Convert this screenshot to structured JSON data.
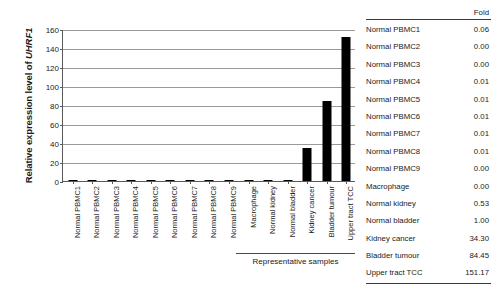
{
  "chart_data": {
    "type": "bar",
    "title": "",
    "xlabel": "Representative samples",
    "ylabel": "Relative expression level of UHRF1",
    "ylabel_plain": "Relative expression level of ",
    "ylabel_gene": "UHRF1",
    "ylim": [
      0,
      160
    ],
    "ytick_step": 20,
    "yticks": [
      0,
      20,
      40,
      60,
      80,
      100,
      120,
      140,
      160
    ],
    "grid": true,
    "legend": "none",
    "bar_color": "#000000",
    "categories": [
      "Normal PBMC1",
      "Normal PBMC2",
      "Normal PBMC3",
      "Normal PBMC4",
      "Normal PBMC5",
      "Normal PBMC6",
      "Normal PBMC7",
      "Normal PBMC8",
      "Normal PBMC9",
      "Macrophage",
      "Normal kidney",
      "Normal bladder",
      "Kidney cancer",
      "Bladder tumour",
      "Upper tract TCC"
    ],
    "values": [
      0.06,
      0.0,
      0.0,
      0.01,
      0.01,
      0.01,
      0.01,
      0.01,
      0.0,
      0.0,
      0.53,
      1.0,
      34.3,
      84.45,
      151.17
    ]
  },
  "bracket": {
    "label": "Representative samples",
    "starts_at_category": "Normal kidney"
  },
  "fold_table": {
    "header": "Fold",
    "rows": [
      {
        "label": "Normal PBMC1",
        "value": "0.06"
      },
      {
        "label": "Normal PBMC2",
        "value": "0.00"
      },
      {
        "label": "Normal PBMC3",
        "value": "0.00"
      },
      {
        "label": "Normal PBMC4",
        "value": "0.01"
      },
      {
        "label": "Normal PBMC5",
        "value": "0.01"
      },
      {
        "label": "Normal PBMC6",
        "value": "0.01"
      },
      {
        "label": "Normal PBMC7",
        "value": "0.01"
      },
      {
        "label": "Normal PBMC8",
        "value": "0.01"
      },
      {
        "label": "Normal PBMC9",
        "value": "0.00"
      },
      {
        "label": "Macrophage",
        "value": "0.00"
      },
      {
        "label": "Normal kidney",
        "value": "0.53"
      },
      {
        "label": "Normal bladder",
        "value": "1.00"
      },
      {
        "label": "Kidney cancer",
        "value": "34.30"
      },
      {
        "label": "Bladder tumour",
        "value": "84.45"
      },
      {
        "label": "Upper tract TCC",
        "value": "151.17"
      }
    ]
  }
}
